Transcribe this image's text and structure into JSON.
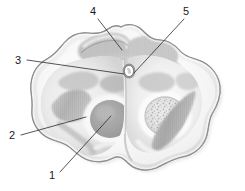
{
  "figure": {
    "background_color": "#ffffff",
    "width": 245,
    "height": 191,
    "style": "grayscale stippled halftone drawing",
    "palette": {
      "outline": "#8d8d8d",
      "capsule_light": "#f1f1f1",
      "tissue_mid": "#d8d8d8",
      "tissue_dark": "#a9a9a9",
      "nucleus_dark": "#9b9b9b",
      "nucleus_mid": "#c2c2c2",
      "speckle": "#b5b5b5",
      "leader_line": "#2b2b2b",
      "label_text": "#1a1a1a"
    }
  },
  "labels": [
    {
      "id": "label-1",
      "text": "1",
      "text_x": 52,
      "text_y": 179,
      "line_from_x": 60,
      "line_from_y": 172,
      "line_to_x": 111,
      "line_to_y": 116,
      "anchor": "lower-left",
      "points_to": "left dark oval nucleus"
    },
    {
      "id": "label-2",
      "text": "2",
      "text_x": 12,
      "text_y": 139,
      "line_from_x": 21,
      "line_from_y": 135,
      "line_to_x": 86,
      "line_to_y": 117,
      "anchor": "left",
      "points_to": "left lateral striated tract"
    },
    {
      "id": "label-3",
      "text": "3",
      "text_x": 18,
      "text_y": 64,
      "line_from_x": 27,
      "line_from_y": 60,
      "line_to_x": 124,
      "line_to_y": 74,
      "anchor": "left",
      "points_to": "central dorsal band"
    },
    {
      "id": "label-4",
      "text": "4",
      "text_x": 93,
      "text_y": 15,
      "line_from_x": 98,
      "line_from_y": 19,
      "line_to_x": 122,
      "line_to_y": 50,
      "anchor": "top",
      "points_to": "dorsal capsule margin"
    },
    {
      "id": "label-5",
      "text": "5",
      "text_x": 186,
      "text_y": 15,
      "line_from_x": 184,
      "line_from_y": 19,
      "line_to_x": 140,
      "line_to_y": 72,
      "anchor": "top-right",
      "points_to": "central canal aperture"
    }
  ]
}
